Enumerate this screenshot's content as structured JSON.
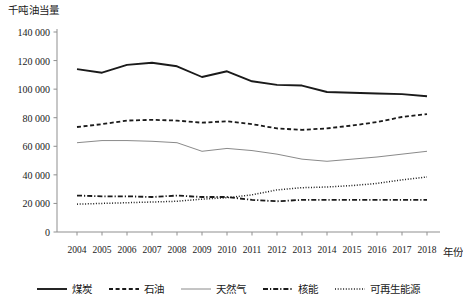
{
  "chart_data": {
    "type": "line",
    "title": "",
    "ylabel": "千吨油当量",
    "xlabel": "年份",
    "ylim": [
      0,
      140000
    ],
    "ytick_labels": [
      "0",
      "20 000",
      "40 000",
      "60 000",
      "80 000",
      "100 000",
      "120 000",
      "140 000"
    ],
    "ytick_values": [
      0,
      20000,
      40000,
      60000,
      80000,
      100000,
      120000,
      140000
    ],
    "grid": false,
    "legend_position": "bottom",
    "categories": [
      2004,
      2005,
      2006,
      2007,
      2008,
      2009,
      2010,
      2011,
      2012,
      2013,
      2014,
      2015,
      2016,
      2017,
      2018
    ],
    "xtick_labels": [
      "2004",
      "2005",
      "2006",
      "2007",
      "2008",
      "2009",
      "2010",
      "2011",
      "2012",
      "2013",
      "2014",
      "2015",
      "2016",
      "2017",
      "2018"
    ],
    "series": [
      {
        "name": "煤炭",
        "style": "solid-thick",
        "color": "#1a1a1a",
        "values": [
          114000,
          111500,
          117000,
          118500,
          116000,
          108500,
          112500,
          105500,
          103000,
          102500,
          98000,
          97500,
          97000,
          96500,
          95000
        ]
      },
      {
        "name": "石油",
        "style": "dashed",
        "color": "#1a1a1a",
        "values": [
          73500,
          75500,
          78000,
          78500,
          78000,
          76500,
          77500,
          75500,
          72500,
          71500,
          72500,
          74500,
          77000,
          80500,
          82500
        ]
      },
      {
        "name": "天然气",
        "style": "solid-thin",
        "color": "#8a8a8a",
        "values": [
          62500,
          64000,
          64000,
          63500,
          62500,
          56500,
          58500,
          57000,
          54500,
          51000,
          49500,
          51000,
          52500,
          54500,
          56500
        ]
      },
      {
        "name": "核能",
        "style": "dash-dot",
        "color": "#1a1a1a",
        "values": [
          25500,
          25000,
          25000,
          24500,
          25500,
          24500,
          24500,
          22500,
          21500,
          22500,
          22500,
          22500,
          22500,
          22500,
          22500
        ]
      },
      {
        "name": "可再生能源",
        "style": "dotted",
        "color": "#1a1a1a",
        "values": [
          19500,
          20000,
          20500,
          21000,
          21500,
          23000,
          24000,
          26000,
          29500,
          31000,
          31500,
          32500,
          34000,
          36500,
          38500
        ]
      }
    ]
  },
  "legend": {
    "items": [
      {
        "label": "煤炭"
      },
      {
        "label": "石油"
      },
      {
        "label": "天然气"
      },
      {
        "label": "核能"
      },
      {
        "label": "可再生能源"
      }
    ]
  }
}
